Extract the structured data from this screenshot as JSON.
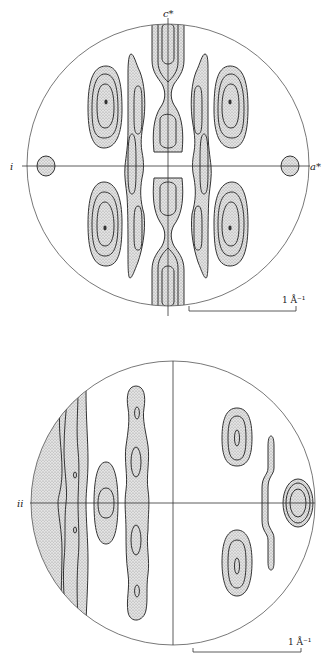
{
  "panels": [
    {
      "id": "i",
      "label": "i",
      "axis_x_label": "a*",
      "axis_y_label": "c*",
      "scale_bar_label": "1 Å⁻¹"
    },
    {
      "id": "ii",
      "label": "ii",
      "scale_bar_label": "1 Å⁻¹"
    }
  ],
  "colors": {
    "line": "#333333",
    "stipple": "#d6d6d6"
  }
}
